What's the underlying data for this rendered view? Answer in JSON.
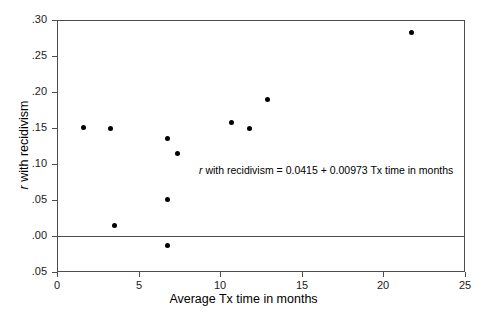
{
  "chart_data": {
    "type": "scatter",
    "title": "",
    "xlabel": "Average Tx time in months",
    "ylabel": "r with recidivism",
    "ylabel_italic_prefix": "r",
    "ylabel_rest": " with recidivism",
    "xlim": [
      0,
      25
    ],
    "ylim": [
      -0.05,
      0.3
    ],
    "xticks": [
      0,
      5,
      10,
      15,
      20,
      25
    ],
    "xtick_labels": [
      "0",
      "5",
      "10",
      "15",
      "20",
      "25"
    ],
    "yticks": [
      0.3,
      0.25,
      0.2,
      0.15,
      0.1,
      0.05,
      0.0,
      -0.05
    ],
    "ytick_labels": [
      ".30",
      ".25",
      ".20",
      ".15",
      ".10",
      ".05",
      ".00",
      ".05"
    ],
    "grid": false,
    "legend": null,
    "zero_reference_line": 0.0,
    "marker": "filled-circle",
    "marker_color": "#000000",
    "annotation": {
      "text": "r with recidivism = 0.0415 + 0.00973 Tx time in months",
      "italic_prefix": "r",
      "rest": " with recidivism = 0.0415 + 0.00973 Tx time in months",
      "x_data": 10.7,
      "y_data": 0.098
    },
    "regression": {
      "intercept": 0.0415,
      "slope": 0.00973,
      "equation": "r with recidivism = 0.0415 + 0.00973 Tx time in months",
      "drawn": false
    },
    "points": [
      {
        "x": 1.6,
        "y": 0.151
      },
      {
        "x": 3.25,
        "y": 0.15
      },
      {
        "x": 3.55,
        "y": 0.014
      },
      {
        "x": 6.75,
        "y": 0.136
      },
      {
        "x": 6.75,
        "y": 0.051
      },
      {
        "x": 6.8,
        "y": -0.013
      },
      {
        "x": 7.4,
        "y": 0.115
      },
      {
        "x": 10.7,
        "y": 0.158
      },
      {
        "x": 11.8,
        "y": 0.149
      },
      {
        "x": 12.9,
        "y": 0.189
      },
      {
        "x": 21.7,
        "y": 0.282
      }
    ]
  }
}
